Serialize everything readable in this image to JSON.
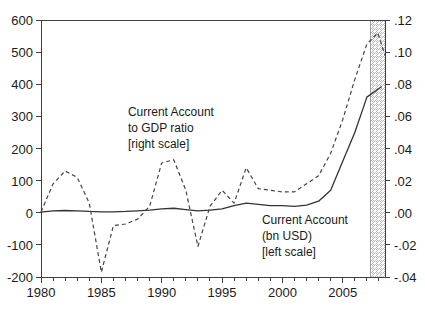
{
  "chart_data": {
    "type": "line",
    "title": "",
    "xlabel": "",
    "ylabel": "",
    "grid": false,
    "legend_position": "inline-annotation",
    "xlim": [
      1980,
      2008.5
    ],
    "x_major_ticks": [
      1980,
      1985,
      1990,
      1995,
      2000,
      2005
    ],
    "x_tick_labels": [
      "1980",
      "1985",
      "1990",
      "1995",
      "2000",
      "2005"
    ],
    "x_minor_tick_interval": 1,
    "left_axis": {
      "label": "bn USD",
      "ylim": [
        -200,
        600
      ],
      "ticks": [
        -200,
        -100,
        0,
        100,
        200,
        300,
        400,
        500,
        600
      ],
      "tick_labels": [
        "-200",
        "-100",
        "0",
        "100",
        "200",
        "300",
        "400",
        "500",
        "600"
      ]
    },
    "right_axis": {
      "label": "ratio",
      "ylim": [
        -0.04,
        0.12
      ],
      "ticks": [
        -0.04,
        -0.02,
        0.0,
        0.02,
        0.04,
        0.06,
        0.08,
        0.1,
        0.12
      ],
      "tick_labels": [
        "-.04",
        "-.02",
        ".00",
        ".02",
        ".04",
        ".06",
        ".08",
        ".10",
        ".12"
      ]
    },
    "forecast_band": {
      "start": 2007.3,
      "end": 2008.5,
      "style": "hatched"
    },
    "series": [
      {
        "name": "Current Account (bn USD)",
        "axis": "left",
        "style": "solid",
        "x": [
          1980,
          1981,
          1982,
          1983,
          1984,
          1985,
          1986,
          1987,
          1988,
          1989,
          1990,
          1991,
          1992,
          1993,
          1994,
          1995,
          1996,
          1997,
          1998,
          1999,
          2000,
          2001,
          2002,
          2003,
          2004,
          2005,
          2006,
          2007,
          2008.2
        ],
        "values": [
          2,
          6,
          7,
          6,
          4,
          3,
          3,
          4,
          6,
          8,
          12,
          14,
          10,
          6,
          8,
          12,
          22,
          30,
          26,
          22,
          22,
          20,
          24,
          36,
          70,
          160,
          250,
          360,
          392
        ]
      },
      {
        "name": "Current Account to GDP ratio",
        "axis": "right",
        "style": "dashed",
        "x": [
          1980,
          1981,
          1982,
          1983,
          1984,
          1985,
          1986,
          1987,
          1988,
          1989,
          1990,
          1991,
          1992,
          1993,
          1994,
          1995,
          1996,
          1997,
          1998,
          1999,
          2000,
          2001,
          2002,
          2003,
          2004,
          2005,
          2006,
          2007,
          2007.9,
          2008.5
        ],
        "values_ratio": [
          0.0005,
          0.018,
          0.026,
          0.022,
          0.006,
          -0.037,
          -0.008,
          -0.007,
          -0.004,
          0.004,
          0.031,
          0.033,
          0.014,
          -0.021,
          0.004,
          0.014,
          0.006,
          0.028,
          0.015,
          0.014,
          0.013,
          0.013,
          0.018,
          0.023,
          0.037,
          0.058,
          0.083,
          0.105,
          0.112,
          0.098
        ]
      }
    ],
    "annotations": [
      {
        "name": "ratio-annotation",
        "lines": [
          "Current Account",
          "to GDP ratio",
          "[right scale]"
        ],
        "x": 1987.2,
        "y_left_scale": 300
      },
      {
        "name": "level-annotation",
        "lines": [
          "Current Account",
          "(bn USD)",
          "[left scale]"
        ],
        "x": 1998.3,
        "y_left_scale": -35
      }
    ]
  },
  "colors": {
    "background": "#ffffff",
    "axis": "#404040",
    "solid_series": "#333333",
    "dashed_series": "#444444",
    "band": "#9a9a9a"
  }
}
